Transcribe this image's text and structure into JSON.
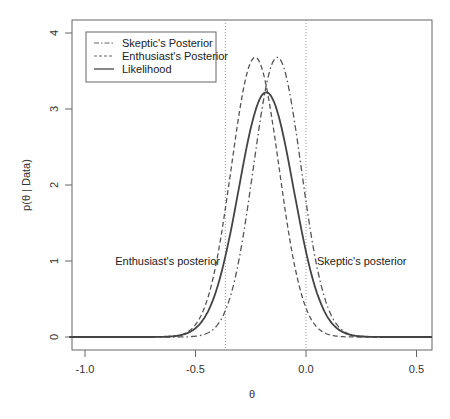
{
  "chart_data": {
    "type": "line",
    "title": "",
    "xlabel": "θ",
    "ylabel": "p(θ | Data)",
    "xlim": [
      -1.07,
      0.57
    ],
    "ylim": [
      0,
      4.15
    ],
    "x_ticks": [
      "-1.0",
      "-0.5",
      "0.0",
      "0.5"
    ],
    "x_tick_values": [
      -1.0,
      -0.5,
      0.0,
      0.5
    ],
    "y_ticks": [
      "0",
      "1",
      "2",
      "3",
      "4"
    ],
    "y_tick_values": [
      0,
      1,
      2,
      3,
      4
    ],
    "grid": false,
    "legend_position": "top-left",
    "series": [
      {
        "name": "Skeptic's Posterior",
        "style": "dashdot",
        "distribution": "normal",
        "mean": -0.13,
        "sd": 0.108,
        "peak": 3.68
      },
      {
        "name": "Enthusiast's Posterior",
        "style": "dashed",
        "distribution": "normal",
        "mean": -0.23,
        "sd": 0.108,
        "peak": 3.68
      },
      {
        "name": "Likelihood",
        "style": "solid",
        "distribution": "normal",
        "mean": -0.18,
        "sd": 0.124,
        "peak": 3.22
      }
    ],
    "vertical_lines": [
      {
        "x": -0.365,
        "style": "dotted"
      },
      {
        "x": 0.0,
        "style": "dotted"
      }
    ],
    "annotations": [
      {
        "text": "Enthusiast's posterior",
        "x": -0.57,
        "y": 1.0
      },
      {
        "text": "Skeptic's posterior",
        "x": 0.18,
        "y": 1.0
      }
    ]
  },
  "legend": {
    "items": [
      "Skeptic's Posterior",
      "Enthusiast's Posterior",
      "Likelihood"
    ]
  },
  "annotations": {
    "enthusiast": "Enthusiast's posterior",
    "skeptic": "Skeptic's posterior"
  },
  "axes": {
    "xlabel": "θ",
    "ylabel": "p(θ | Data)",
    "x_ticks": [
      "-1.0",
      "-0.5",
      "0.0",
      "0.5"
    ],
    "y_ticks": [
      "0",
      "1",
      "2",
      "3",
      "4"
    ]
  }
}
